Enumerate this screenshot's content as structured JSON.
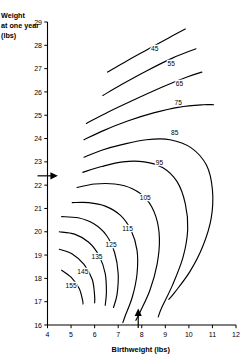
{
  "chart_data": {
    "type": "line",
    "title": "",
    "xlabel": "Birthweight (lbs)",
    "ylabel": "Weight at one year (lbs)",
    "xlim": [
      4,
      12
    ],
    "ylim": [
      16,
      29
    ],
    "xticks": [
      "4",
      "5",
      "6",
      "7",
      "8",
      "9",
      "10",
      "11",
      "12"
    ],
    "yticks": [
      "16",
      "17",
      "18",
      "19",
      "20",
      "21",
      "22",
      "23",
      "24",
      "25",
      "26",
      "27",
      "28",
      "29"
    ],
    "grid": false,
    "legend": "none",
    "annotations": [
      {
        "name": "y-marker-arrow",
        "axis": "y",
        "value": 22.4,
        "direction": "right"
      },
      {
        "name": "x-marker-arrow",
        "axis": "x",
        "value": 7.85,
        "direction": "up"
      }
    ],
    "series": [
      {
        "name": "45",
        "label": "45",
        "label_x": 8.55,
        "label_y": 27.75,
        "points": [
          [
            6.55,
            26.85
          ],
          [
            7.4,
            27.35
          ],
          [
            8.3,
            27.85
          ],
          [
            9.2,
            28.35
          ],
          [
            9.85,
            28.7
          ]
        ]
      },
      {
        "name": "55",
        "label": "55",
        "label_x": 9.25,
        "label_y": 27.1,
        "points": [
          [
            6.35,
            25.85
          ],
          [
            7.2,
            26.35
          ],
          [
            8.2,
            26.9
          ],
          [
            9.3,
            27.45
          ],
          [
            10.3,
            27.85
          ]
        ]
      },
      {
        "name": "65",
        "label": "65",
        "label_x": 9.6,
        "label_y": 26.25,
        "points": [
          [
            5.65,
            24.65
          ],
          [
            6.6,
            25.15
          ],
          [
            7.65,
            25.65
          ],
          [
            8.85,
            26.2
          ],
          [
            9.95,
            26.65
          ],
          [
            10.55,
            26.85
          ]
        ]
      },
      {
        "name": "75",
        "label": "75",
        "label_x": 9.55,
        "label_y": 25.45,
        "points": [
          [
            5.55,
            23.95
          ],
          [
            6.4,
            24.35
          ],
          [
            7.4,
            24.75
          ],
          [
            8.5,
            25.1
          ],
          [
            9.6,
            25.35
          ],
          [
            10.6,
            25.45
          ],
          [
            11.05,
            25.45
          ]
        ]
      },
      {
        "name": "85",
        "label": "85",
        "label_x": 9.4,
        "label_y": 24.15,
        "points": [
          [
            5.55,
            23.2
          ],
          [
            6.3,
            23.5
          ],
          [
            7.2,
            23.75
          ],
          [
            8.2,
            23.95
          ],
          [
            9.2,
            23.95
          ],
          [
            10.1,
            23.6
          ],
          [
            10.75,
            22.85
          ],
          [
            11.0,
            21.8
          ],
          [
            10.95,
            20.6
          ],
          [
            10.6,
            19.4
          ],
          [
            10.05,
            18.3
          ],
          [
            9.4,
            17.4
          ],
          [
            9.15,
            17.1
          ]
        ]
      },
      {
        "name": "95",
        "label": "95",
        "label_x": 8.75,
        "label_y": 22.85,
        "points": [
          [
            5.5,
            22.55
          ],
          [
            6.3,
            22.8
          ],
          [
            7.2,
            23.0
          ],
          [
            8.1,
            23.0
          ],
          [
            8.9,
            22.75
          ],
          [
            9.5,
            22.15
          ],
          [
            9.85,
            21.2
          ],
          [
            9.95,
            20.1
          ],
          [
            9.75,
            18.9
          ],
          [
            9.3,
            17.7
          ],
          [
            8.85,
            16.75
          ],
          [
            8.7,
            16.35
          ]
        ]
      },
      {
        "name": "105",
        "label": "105",
        "label_x": 8.15,
        "label_y": 21.35,
        "points": [
          [
            5.25,
            21.9
          ],
          [
            6.0,
            22.05
          ],
          [
            6.85,
            22.05
          ],
          [
            7.6,
            21.85
          ],
          [
            8.2,
            21.4
          ],
          [
            8.6,
            20.65
          ],
          [
            8.75,
            19.7
          ],
          [
            8.65,
            18.6
          ],
          [
            8.35,
            17.5
          ],
          [
            7.95,
            16.6
          ],
          [
            7.75,
            16.2
          ]
        ]
      },
      {
        "name": "115",
        "label": "115",
        "label_x": 7.4,
        "label_y": 20.05,
        "points": [
          [
            5.05,
            21.25
          ],
          [
            5.75,
            21.25
          ],
          [
            6.45,
            21.1
          ],
          [
            7.1,
            20.7
          ],
          [
            7.55,
            20.05
          ],
          [
            7.8,
            19.2
          ],
          [
            7.8,
            18.2
          ],
          [
            7.6,
            17.2
          ],
          [
            7.3,
            16.4
          ],
          [
            7.2,
            16.1
          ]
        ]
      },
      {
        "name": "125",
        "label": "125",
        "label_x": 6.7,
        "label_y": 19.35,
        "points": [
          [
            4.6,
            20.65
          ],
          [
            5.3,
            20.6
          ],
          [
            5.95,
            20.35
          ],
          [
            6.5,
            19.85
          ],
          [
            6.85,
            19.1
          ],
          [
            7.0,
            18.2
          ],
          [
            6.95,
            17.3
          ],
          [
            6.8,
            16.75
          ]
        ]
      },
      {
        "name": "135",
        "label": "135",
        "label_x": 6.1,
        "label_y": 18.85,
        "points": [
          [
            4.5,
            20.0
          ],
          [
            5.15,
            19.9
          ],
          [
            5.75,
            19.55
          ],
          [
            6.2,
            18.95
          ],
          [
            6.45,
            18.2
          ],
          [
            6.5,
            17.4
          ],
          [
            6.45,
            16.85
          ]
        ]
      },
      {
        "name": "145",
        "label": "145",
        "label_x": 5.5,
        "label_y": 18.2,
        "points": [
          [
            4.5,
            19.25
          ],
          [
            5.05,
            19.05
          ],
          [
            5.55,
            18.6
          ],
          [
            5.9,
            17.95
          ],
          [
            6.0,
            17.25
          ],
          [
            6.0,
            16.95
          ]
        ]
      },
      {
        "name": "155",
        "label": "155",
        "label_x": 5.0,
        "label_y": 17.6,
        "points": [
          [
            4.6,
            18.35
          ],
          [
            5.0,
            18.05
          ],
          [
            5.35,
            17.55
          ],
          [
            5.5,
            17.0
          ],
          [
            5.5,
            16.9
          ]
        ]
      }
    ]
  }
}
